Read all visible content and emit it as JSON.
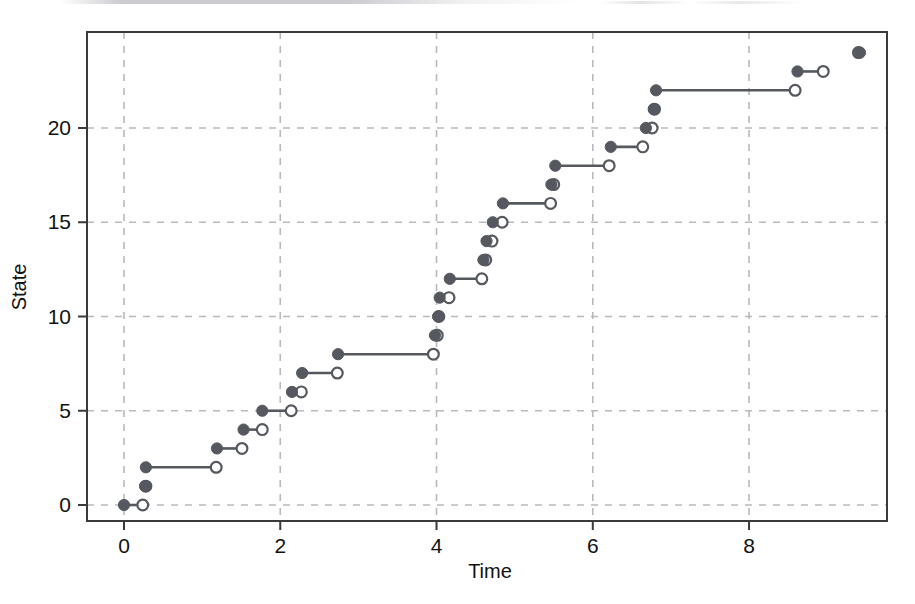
{
  "figure": {
    "title": "",
    "background_color": "#ffffff",
    "series_color": "#55585e",
    "grid_color": "#b9b9bd",
    "axis_color": "#3a3a3a"
  },
  "axes": {
    "xlabel": "Time",
    "ylabel": "State",
    "x_ticks": [
      "0",
      "2",
      "4",
      "6",
      "8"
    ],
    "x_tick_values": [
      0,
      2,
      4,
      6,
      8
    ],
    "y_ticks": [
      "0",
      "5",
      "10",
      "15",
      "20"
    ],
    "y_tick_values": [
      0,
      5,
      10,
      15,
      20
    ],
    "xlim": [
      -0.45,
      9.78
    ],
    "ylim": [
      -1.35,
      25.1
    ],
    "grid": true,
    "grid_style": "dashed"
  },
  "chart_data": {
    "type": "line",
    "subtype": "step-function",
    "title": "",
    "xlabel": "Time",
    "ylabel": "State",
    "xlim": [
      -0.45,
      9.78
    ],
    "ylim": [
      -1.35,
      25.1
    ],
    "grid": true,
    "legend": null,
    "marker_closed": "filled-circle",
    "marker_open": "open-circle",
    "series": [
      {
        "name": "State",
        "color": "#55585e",
        "x_start": [
          0.0,
          0.27,
          0.28,
          1.19,
          1.53,
          1.77,
          2.15,
          2.28,
          2.74,
          3.98,
          4.02,
          4.04,
          4.17,
          4.6,
          4.64,
          4.72,
          4.85,
          5.47,
          5.52,
          6.23,
          6.68,
          6.78,
          6.81,
          8.62,
          9.42
        ],
        "x_end": [
          0.24,
          0.28,
          1.18,
          1.51,
          1.77,
          2.14,
          2.27,
          2.73,
          3.96,
          4.01,
          4.03,
          4.16,
          4.58,
          4.63,
          4.71,
          4.84,
          5.46,
          5.5,
          6.21,
          6.64,
          6.76,
          6.79,
          8.59,
          8.95,
          9.4
        ],
        "y": [
          0,
          1,
          2,
          3,
          4,
          5,
          6,
          7,
          8,
          9,
          10,
          11,
          12,
          13,
          14,
          15,
          16,
          17,
          18,
          19,
          20,
          21,
          22,
          23,
          24
        ],
        "note_last": "state 24 has no open endpoint drawn (series ends at the last observed jump)"
      }
    ]
  }
}
